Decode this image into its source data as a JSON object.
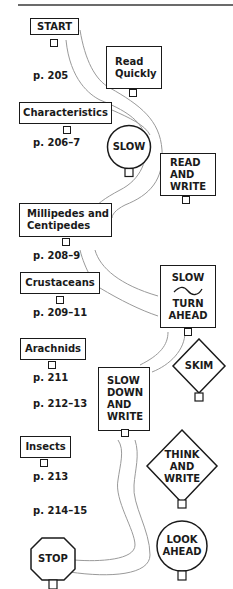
{
  "diagram": {
    "type": "reading-road-map",
    "sections": [
      {
        "label": "START",
        "page": "p. 205"
      },
      {
        "label": "Characteristics",
        "page": "p. 206–7"
      },
      {
        "label": "Millipedes and Centipedes",
        "label_line1": "Millipedes and",
        "label_line2": "Centipedes",
        "page": "p. 208–9"
      },
      {
        "label": "Crustaceans",
        "page": "p. 209–11"
      },
      {
        "label": "Arachnids",
        "page": "p. 211",
        "page2": "p. 212–13"
      },
      {
        "label": "Insects",
        "page": "p. 213",
        "page2": "p. 214–15"
      },
      {
        "label": "STOP"
      }
    ],
    "road_signs": [
      {
        "shape": "rectangle",
        "line1": "Read",
        "line2": "Quickly"
      },
      {
        "shape": "circle",
        "line1": "SLOW"
      },
      {
        "shape": "rectangle",
        "line1": "READ",
        "line2": "AND",
        "line3": "WRITE"
      },
      {
        "shape": "rectangle",
        "line1": "SLOW",
        "icon": "curve-ahead-icon",
        "line2": "TURN",
        "line3": "AHEAD"
      },
      {
        "shape": "diamond",
        "line1": "SKIM"
      },
      {
        "shape": "rectangle",
        "line1": "SLOW",
        "line2": "DOWN",
        "line3": "AND",
        "line4": "WRITE"
      },
      {
        "shape": "diamond",
        "line1": "THINK",
        "line2": "AND",
        "line3": "WRITE"
      },
      {
        "shape": "circle",
        "line1": "LOOK",
        "line2": "AHEAD"
      },
      {
        "shape": "octagon",
        "line1": "STOP"
      }
    ]
  }
}
